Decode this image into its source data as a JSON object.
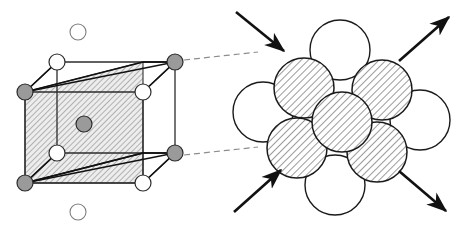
{
  "figure": {
    "type": "diagram",
    "width": 456,
    "height": 231,
    "background": "#ffffff"
  },
  "colors": {
    "atom_gray_fill": "#9a9a9a",
    "atom_white_fill": "#ffffff",
    "outline": "#1a1a1a",
    "outline_soft": "#444444",
    "plane_hatch": "#8c8c8c",
    "plane_fill": "#e3e3e3",
    "dashed_callout": "#8d8d8d",
    "arrow": "#111111"
  },
  "left_panel": {
    "name": "unit-cell-diagram",
    "cube": {
      "front_face": [
        [
          25,
          92
        ],
        [
          25,
          183
        ],
        [
          143,
          183
        ],
        [
          143,
          92
        ]
      ],
      "back_face": [
        [
          57,
          62
        ],
        [
          57,
          153
        ],
        [
          175,
          153
        ],
        [
          175,
          62
        ]
      ],
      "slip_plane_polygon": [
        [
          25,
          92
        ],
        [
          143,
          62
        ],
        [
          143,
          183
        ],
        [
          25,
          183
        ]
      ],
      "hatch_angle_deg": 45
    },
    "atoms": [
      {
        "id": "corner-back-top-left",
        "cx": 57,
        "cy": 62,
        "r": 8,
        "fill": "white",
        "label": "white-atom"
      },
      {
        "id": "corner-back-top-right",
        "cx": 175,
        "cy": 62,
        "r": 8,
        "fill": "gray",
        "label": "gray-atom"
      },
      {
        "id": "corner-front-top-left",
        "cx": 25,
        "cy": 92,
        "r": 8,
        "fill": "gray",
        "label": "gray-atom"
      },
      {
        "id": "corner-front-top-right",
        "cx": 143,
        "cy": 92,
        "r": 8,
        "fill": "white",
        "label": "white-atom"
      },
      {
        "id": "body-center",
        "cx": 84,
        "cy": 124,
        "r": 8,
        "fill": "gray",
        "label": "gray-atom"
      },
      {
        "id": "corner-front-bottom-left",
        "cx": 25,
        "cy": 183,
        "r": 8,
        "fill": "gray",
        "label": "gray-atom"
      },
      {
        "id": "corner-front-bottom-right",
        "cx": 143,
        "cy": 183,
        "r": 8,
        "fill": "white",
        "label": "white-atom"
      },
      {
        "id": "corner-back-bottom-left",
        "cx": 57,
        "cy": 153,
        "r": 8,
        "fill": "white",
        "label": "white-atom"
      },
      {
        "id": "corner-back-bottom-right",
        "cx": 175,
        "cy": 153,
        "r": 8,
        "fill": "gray",
        "label": "gray-atom"
      },
      {
        "id": "satellite-above",
        "cx": 78,
        "cy": 32,
        "r": 8,
        "fill": "white",
        "label": "white-atom"
      },
      {
        "id": "satellite-below",
        "cx": 78,
        "cy": 212,
        "r": 8,
        "fill": "white",
        "label": "white-atom"
      }
    ],
    "callout_lines": [
      {
        "id": "callout-upper",
        "x1": 184,
        "y1": 60,
        "x2": 258,
        "y2": 52
      },
      {
        "id": "callout-lower",
        "x1": 184,
        "y1": 155,
        "x2": 258,
        "y2": 147
      }
    ]
  },
  "right_panel": {
    "name": "close-packed-plane-diagram",
    "atoms": [
      {
        "id": "white-top",
        "cx": 340,
        "cy": 50,
        "r": 30,
        "fill": "white",
        "label": "white-atom"
      },
      {
        "id": "hatched-upper-left",
        "cx": 304,
        "cy": 88,
        "r": 30,
        "fill": "hatched",
        "label": "hatched-atom"
      },
      {
        "id": "hatched-upper-right",
        "cx": 382,
        "cy": 90,
        "r": 30,
        "fill": "hatched",
        "label": "hatched-atom"
      },
      {
        "id": "white-left",
        "cx": 263,
        "cy": 112,
        "r": 30,
        "fill": "white",
        "label": "white-atom"
      },
      {
        "id": "hatched-center",
        "cx": 342,
        "cy": 122,
        "r": 30,
        "fill": "hatched",
        "label": "hatched-atom"
      },
      {
        "id": "white-right",
        "cx": 420,
        "cy": 120,
        "r": 30,
        "fill": "white",
        "label": "white-atom"
      },
      {
        "id": "hatched-lower-left",
        "cx": 297,
        "cy": 148,
        "r": 30,
        "fill": "hatched",
        "label": "hatched-atom"
      },
      {
        "id": "hatched-lower-right",
        "cx": 377,
        "cy": 152,
        "r": 30,
        "fill": "hatched",
        "label": "hatched-atom"
      },
      {
        "id": "white-bottom",
        "cx": 335,
        "cy": 185,
        "r": 30,
        "fill": "white",
        "label": "white-atom"
      }
    ],
    "arrows": [
      {
        "id": "arrow-top-left",
        "x1": 236,
        "y1": 12,
        "x2": 286,
        "y2": 52,
        "head": "end",
        "direction": "down-right"
      },
      {
        "id": "arrow-top-right",
        "x1": 400,
        "y1": 60,
        "x2": 450,
        "y2": 18,
        "head": "end",
        "direction": "up-right"
      },
      {
        "id": "arrow-bottom-left",
        "x1": 234,
        "y1": 212,
        "x2": 283,
        "y2": 170,
        "head": "start",
        "direction": "up-right"
      },
      {
        "id": "arrow-bottom-right",
        "x1": 400,
        "y1": 172,
        "x2": 447,
        "y2": 212,
        "head": "end",
        "direction": "down-right"
      }
    ],
    "hatch_angle_deg": 45
  }
}
